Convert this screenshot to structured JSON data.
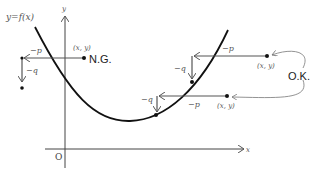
{
  "diagram": {
    "title_curve_label": "y=f(x)",
    "axes": {
      "x_label": "x",
      "y_label": "y",
      "origin_label": "O"
    },
    "cases": [
      {
        "name": "ng",
        "status_label": "N.G.",
        "point_label": "(x, y)",
        "p_label": "−p",
        "q_label": "−q"
      },
      {
        "name": "ok-upper",
        "point_label": "(x, y)",
        "p_label": "−p",
        "q_label": "−q"
      },
      {
        "name": "ok-lower",
        "point_label": "(x, y)",
        "p_label": "−p",
        "q_label": "−q"
      }
    ],
    "ok_label": "O.K.",
    "colors": {
      "curve": "#111111",
      "arrow": "#555555",
      "axis": "#444444",
      "connector": "#777777"
    }
  }
}
